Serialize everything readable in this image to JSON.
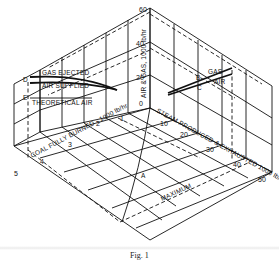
{
  "figure": {
    "type": "isometric 3D diagram",
    "caption": "Fig. 1",
    "vertical_axis": {
      "label": "AIR & GAS, 1000 lb/hr",
      "ticks": [
        "20",
        "40",
        "60"
      ]
    },
    "left_axis": {
      "label": "COAL FULLY BURNED - 1000 lb/hr",
      "ticks": [
        "1",
        "2",
        "3",
        "4",
        "5"
      ]
    },
    "right_axis": {
      "label": "STEAM PRODUCED & EXHAUSTED 1000 lb/hr",
      "ticks": [
        "0",
        "10",
        "20",
        "30",
        "40",
        "50"
      ]
    },
    "left_panel_labels": {
      "gas_ejected": "GAS EJECTED",
      "air_supplied": "AIR SUPPLIED",
      "theoretical_air": "THEORETICAL AIR",
      "point_d": "D",
      "point_e": "E"
    },
    "right_panel_labels": {
      "gas": "GAS",
      "air": "AIR",
      "point_b": "B",
      "point_c": "C"
    },
    "floor_labels": {
      "curve": "A",
      "maximum": "MAXIMUM"
    }
  }
}
